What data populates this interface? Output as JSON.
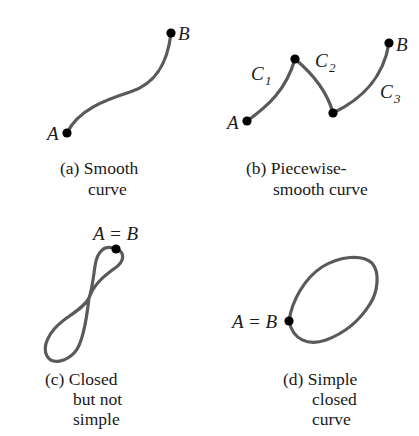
{
  "panels": [
    {
      "id": "a",
      "caption_lines": [
        "(a) Smooth",
        "curve"
      ],
      "labels": {
        "start": "A",
        "end": "B"
      }
    },
    {
      "id": "b",
      "caption_lines": [
        "(b) Piecewise-",
        "smooth curve"
      ],
      "labels": {
        "start": "A",
        "end": "B"
      },
      "segments": [
        {
          "main": "C",
          "sub": "1"
        },
        {
          "main": "C",
          "sub": "2"
        },
        {
          "main": "C",
          "sub": "3"
        }
      ]
    },
    {
      "id": "c",
      "caption_lines": [
        "(c) Closed",
        "but not",
        "simple"
      ],
      "labels": {
        "point": "A = B"
      }
    },
    {
      "id": "d",
      "caption_lines": [
        "(d) Simple",
        "closed",
        "curve"
      ],
      "labels": {
        "point": "A = B"
      }
    }
  ],
  "colors": {
    "curve": "#5a5a5a",
    "dot": "#000000",
    "text": "#1a1a1a"
  }
}
